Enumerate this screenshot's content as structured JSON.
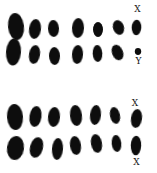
{
  "figure": {
    "background": "#ffffff",
    "ink": "#101010",
    "width": 157,
    "height": 173,
    "groups": [
      {
        "name": "male-chromosome-set",
        "sex_labels": [
          "X",
          "Y"
        ]
      },
      {
        "name": "female-chromosome-set",
        "sex_labels": [
          "X",
          "X"
        ]
      }
    ],
    "labels": [
      {
        "text": "X",
        "x": 137.5,
        "y": 9,
        "name": "label-x-male-top"
      },
      {
        "text": "Y",
        "x": 138.5,
        "y": 60.5,
        "name": "label-y-male-bottom"
      },
      {
        "text": "X",
        "x": 135,
        "y": 102.5,
        "name": "label-x-female-top"
      },
      {
        "text": "X",
        "x": 136.5,
        "y": 161.5,
        "name": "label-x-female-bottom"
      }
    ],
    "blobs": [
      {
        "name": "male-row1-autosome-1",
        "cx": 16,
        "cy": 26.5,
        "rx": 8,
        "ry": 13.5,
        "rot": -6
      },
      {
        "name": "male-row1-autosome-2",
        "cx": 35,
        "cy": 29,
        "rx": 6,
        "ry": 10,
        "rot": 7
      },
      {
        "name": "male-row1-autosome-3",
        "cx": 53.5,
        "cy": 28.5,
        "rx": 5.5,
        "ry": 8.5,
        "rot": -3
      },
      {
        "name": "male-row1-autosome-4",
        "cx": 78,
        "cy": 28,
        "rx": 6,
        "ry": 10,
        "rot": 3
      },
      {
        "name": "male-row1-autosome-5",
        "cx": 98,
        "cy": 29.5,
        "rx": 5,
        "ry": 7.5,
        "rot": 0
      },
      {
        "name": "male-row1-autosome-6",
        "cx": 118.5,
        "cy": 27.5,
        "rx": 5.5,
        "ry": 7.5,
        "rot": -18
      },
      {
        "name": "male-x-chromosome",
        "cx": 136.5,
        "cy": 27.5,
        "rx": 4.8,
        "ry": 7.8,
        "rot": 3
      },
      {
        "name": "male-row2-autosome-1",
        "cx": 13.5,
        "cy": 52,
        "rx": 7.5,
        "ry": 13.5,
        "rot": 4
      },
      {
        "name": "male-row2-autosome-2",
        "cx": 34.5,
        "cy": 54.5,
        "rx": 5.5,
        "ry": 9.5,
        "rot": 9
      },
      {
        "name": "male-row2-autosome-3",
        "cx": 54.5,
        "cy": 56,
        "rx": 5.5,
        "ry": 9,
        "rot": -2
      },
      {
        "name": "male-row2-autosome-4",
        "cx": 77.5,
        "cy": 54.5,
        "rx": 5.5,
        "ry": 9.5,
        "rot": 4
      },
      {
        "name": "male-row2-autosome-5",
        "cx": 97.5,
        "cy": 53.5,
        "rx": 4.8,
        "ry": 8.5,
        "rot": -3
      },
      {
        "name": "male-row2-autosome-6",
        "cx": 117.5,
        "cy": 52.5,
        "rx": 5.5,
        "ry": 8,
        "rot": -22
      },
      {
        "name": "male-y-chromosome",
        "cx": 138,
        "cy": 51.5,
        "rx": 3.2,
        "ry": 3.4,
        "rot": 0
      },
      {
        "name": "female-row1-autosome-1",
        "cx": 15,
        "cy": 117,
        "rx": 8,
        "ry": 13,
        "rot": -4
      },
      {
        "name": "female-row1-autosome-2",
        "cx": 35.5,
        "cy": 116.5,
        "rx": 6,
        "ry": 10.5,
        "rot": 8
      },
      {
        "name": "female-row1-autosome-3",
        "cx": 54,
        "cy": 117,
        "rx": 6,
        "ry": 10,
        "rot": 5
      },
      {
        "name": "female-row1-autosome-4",
        "cx": 76,
        "cy": 115.5,
        "rx": 6,
        "ry": 10.5,
        "rot": -6
      },
      {
        "name": "female-row1-autosome-5",
        "cx": 95.5,
        "cy": 115,
        "rx": 5.5,
        "ry": 10,
        "rot": 6
      },
      {
        "name": "female-row1-autosome-6",
        "cx": 115,
        "cy": 115.5,
        "rx": 5,
        "ry": 8.5,
        "rot": -12
      },
      {
        "name": "female-x-chromosome-top",
        "cx": 136.5,
        "cy": 118.5,
        "rx": 5.5,
        "ry": 9.5,
        "rot": 8
      },
      {
        "name": "female-row2-autosome-1",
        "cx": 15.5,
        "cy": 148,
        "rx": 8.5,
        "ry": 12,
        "rot": 7
      },
      {
        "name": "female-row2-autosome-2",
        "cx": 36.5,
        "cy": 147.5,
        "rx": 6.5,
        "ry": 10.5,
        "rot": 14
      },
      {
        "name": "female-row2-autosome-3",
        "cx": 57.5,
        "cy": 149,
        "rx": 5.5,
        "ry": 11,
        "rot": 4
      },
      {
        "name": "female-row2-autosome-4",
        "cx": 75.5,
        "cy": 145.5,
        "rx": 5.5,
        "ry": 9.5,
        "rot": -8
      },
      {
        "name": "female-row2-autosome-5",
        "cx": 96.5,
        "cy": 143.5,
        "rx": 5.5,
        "ry": 9.5,
        "rot": -10
      },
      {
        "name": "female-row2-autosome-6",
        "cx": 116.5,
        "cy": 143.5,
        "rx": 4.8,
        "ry": 8.5,
        "rot": -6
      },
      {
        "name": "female-x-chromosome-bottom",
        "cx": 136,
        "cy": 145.5,
        "rx": 5.2,
        "ry": 9.8,
        "rot": 2
      }
    ]
  }
}
